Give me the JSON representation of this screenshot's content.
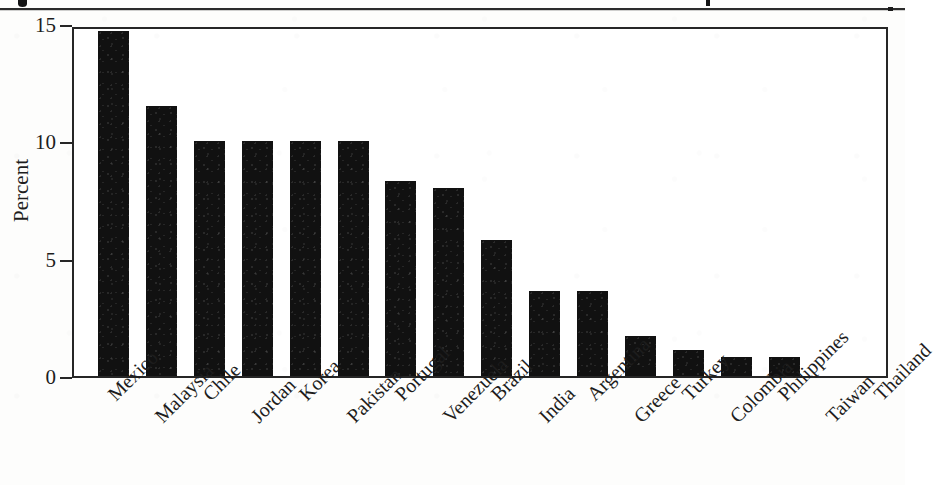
{
  "figure": {
    "has_top_rule": true,
    "background_color": "#fdfdfc",
    "bar_color": "#111111",
    "axis_color": "#262626",
    "text_color": "#1d1d1d"
  },
  "chart_data": {
    "type": "bar",
    "title": "",
    "xlabel": "",
    "ylabel": "Percent",
    "ylim": [
      0,
      15
    ],
    "yticks": [
      0,
      5,
      10,
      15
    ],
    "ytick_labels": [
      "0",
      "5",
      "10",
      "15"
    ],
    "grid": false,
    "legend": null,
    "orientation": "vertical",
    "categories": [
      "Mexico",
      "Malaysia",
      "Chile",
      "Jordan",
      "Korea",
      "Pakistan",
      "Portugal",
      "Venezuela",
      "Brazil",
      "India",
      "Argentina",
      "Greece",
      "Turkey",
      "Colombia",
      "Philippines",
      "Taiwan",
      "Thailand"
    ],
    "values": [
      14.7,
      11.5,
      10.0,
      10.0,
      10.0,
      10.0,
      8.3,
      8.0,
      5.8,
      3.6,
      3.6,
      1.7,
      1.1,
      0.8,
      0.8,
      0.0,
      0.0
    ],
    "tick_label_rotation": -45,
    "tick_label_stagger": true
  }
}
